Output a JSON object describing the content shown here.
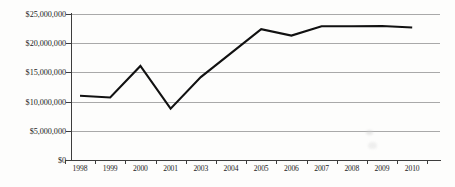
{
  "chart_data": {
    "type": "line",
    "title": "",
    "subtitle": "",
    "xlabel": "",
    "ylabel": "",
    "categories": [
      "1998",
      "1999",
      "2000",
      "2001",
      "2003",
      "2004",
      "2005",
      "2006",
      "2007",
      "2008",
      "2009",
      "2010"
    ],
    "values": [
      11000000,
      10700000,
      16100000,
      8800000,
      14200000,
      18300000,
      22400000,
      21300000,
      22900000,
      22900000,
      22950000,
      22700000
    ],
    "series": [
      {
        "name": "",
        "values": [
          11000000,
          10700000,
          16100000,
          8800000,
          14200000,
          18300000,
          22400000,
          21300000,
          22900000,
          22900000,
          22950000,
          22700000
        ]
      }
    ],
    "ylim": [
      0,
      25000000
    ],
    "ytick_values": [
      0,
      5000000,
      10000000,
      15000000,
      20000000,
      25000000
    ],
    "ytick_labels": [
      "$0",
      "$5,000,000",
      "$10,000,000",
      "$15,000,000",
      "$20,000,000",
      "$25,000,000"
    ],
    "grid": true,
    "grid_axis": "y",
    "legend": false,
    "legend_position": "none",
    "line_color": "#111111",
    "grid_color": "#a9a9a9",
    "axis_color": "#3d3d3d",
    "background_color": "#fdfdfc",
    "annotations": []
  },
  "axis": {
    "y_labels": [
      {
        "text": "$25,000,000",
        "value": 25000000
      },
      {
        "text": "$20,000,000",
        "value": 20000000
      },
      {
        "text": "$15,000,000",
        "value": 15000000
      },
      {
        "text": "$10,000,000",
        "value": 10000000
      },
      {
        "text": "$5,000,000",
        "value": 5000000
      },
      {
        "text": "$0",
        "value": 0
      }
    ],
    "x_labels": [
      "1998",
      "1999",
      "2000",
      "2001",
      "2003",
      "2004",
      "2005",
      "2006",
      "2007",
      "2008",
      "2009",
      "2010"
    ]
  }
}
